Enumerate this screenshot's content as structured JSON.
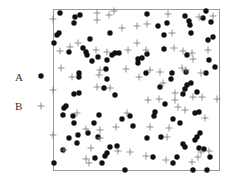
{
  "chart_data": {
    "type": "scatter",
    "title": "",
    "xlabel": "",
    "ylabel": "",
    "grid": false,
    "legend_position": "left",
    "frame": {
      "x0": 53,
      "y0": 9,
      "x1": 219,
      "y1": 170
    },
    "series": [
      {
        "name": "A",
        "marker": "filled-circle",
        "color": "#111111",
        "points": [
          [
            60,
            13
          ],
          [
            75,
            17
          ],
          [
            80,
            15
          ],
          [
            74,
            23
          ],
          [
            59,
            33
          ],
          [
            57,
            35
          ],
          [
            54,
            43
          ],
          [
            69,
            52
          ],
          [
            90,
            39
          ],
          [
            83,
            48
          ],
          [
            86,
            52
          ],
          [
            87,
            55
          ],
          [
            92,
            61
          ],
          [
            98,
            57
          ],
          [
            110,
            33
          ],
          [
            107,
            60
          ],
          [
            112,
            55
          ],
          [
            115,
            53
          ],
          [
            119,
            53
          ],
          [
            79,
            73
          ],
          [
            79,
            77
          ],
          [
            106,
            69
          ],
          [
            107,
            79
          ],
          [
            104,
            88
          ],
          [
            115,
            95
          ],
          [
            79,
            93
          ],
          [
            74,
            94
          ],
          [
            66,
            106
          ],
          [
            64,
            108
          ],
          [
            63,
            115
          ],
          [
            73,
            116
          ],
          [
            74,
            123
          ],
          [
            99,
            115
          ],
          [
            94,
            123
          ],
          [
            78,
            135
          ],
          [
            69,
            138
          ],
          [
            77,
            143
          ],
          [
            63,
            150
          ],
          [
            88,
            133
          ],
          [
            98,
            137
          ],
          [
            110,
            147
          ],
          [
            117,
            146
          ],
          [
            107,
            153
          ],
          [
            105,
            156
          ],
          [
            95,
            158
          ],
          [
            102,
            163
          ],
          [
            54,
            163
          ],
          [
            125,
            170
          ],
          [
            122,
            119
          ],
          [
            130,
            116
          ],
          [
            133,
            126
          ],
          [
            147,
            14
          ],
          [
            158,
            26
          ],
          [
            167,
            23
          ],
          [
            164,
            35
          ],
          [
            164,
            49
          ],
          [
            147,
            54
          ],
          [
            138,
            59
          ],
          [
            142,
            58
          ],
          [
            138,
            63
          ],
          [
            146,
            73
          ],
          [
            172,
            73
          ],
          [
            171,
            79
          ],
          [
            160,
            87
          ],
          [
            165,
            104
          ],
          [
            155,
            112
          ],
          [
            154,
            116
          ],
          [
            147,
            138
          ],
          [
            161,
            137
          ],
          [
            173,
            119
          ],
          [
            180,
            123
          ],
          [
            153,
            157
          ],
          [
            173,
            163
          ],
          [
            177,
            157
          ],
          [
            185,
            16
          ],
          [
            189,
            21
          ],
          [
            190,
            25
          ],
          [
            191,
            33
          ],
          [
            206,
            11
          ],
          [
            203,
            18
          ],
          [
            211,
            22
          ],
          [
            208,
            40
          ],
          [
            213,
            37
          ],
          [
            209,
            60
          ],
          [
            215,
            67
          ],
          [
            206,
            73
          ],
          [
            187,
            55
          ],
          [
            186,
            72
          ],
          [
            191,
            83
          ],
          [
            187,
            85
          ],
          [
            185,
            89
          ],
          [
            183,
            94
          ],
          [
            197,
            92
          ],
          [
            199,
            112
          ],
          [
            195,
            113
          ],
          [
            200,
            133
          ],
          [
            197,
            137
          ],
          [
            195,
            140
          ],
          [
            183,
            144
          ],
          [
            185,
            147
          ],
          [
            199,
            148
          ],
          [
            204,
            149
          ],
          [
            210,
            157
          ],
          [
            193,
            170
          ],
          [
            207,
            170
          ]
        ]
      },
      {
        "name": "B",
        "marker": "plus",
        "color": "#777777",
        "points": [
          [
            53,
            19
          ],
          [
            97,
            13
          ],
          [
            109,
            15
          ],
          [
            114,
            11
          ],
          [
            97,
            20
          ],
          [
            122,
            28
          ],
          [
            137,
            26
          ],
          [
            147,
            24
          ],
          [
            168,
            14
          ],
          [
            199,
            17
          ],
          [
            213,
            16
          ],
          [
            172,
            33
          ],
          [
            137,
            43
          ],
          [
            78,
            43
          ],
          [
            70,
            47
          ],
          [
            60,
            51
          ],
          [
            96,
            50
          ],
          [
            107,
            52
          ],
          [
            128,
            50
          ],
          [
            146,
            50
          ],
          [
            174,
            48
          ],
          [
            183,
            51
          ],
          [
            192,
            53
          ],
          [
            193,
            59
          ],
          [
            208,
            50
          ],
          [
            61,
            68
          ],
          [
            100,
            70
          ],
          [
            99,
            75
          ],
          [
            126,
            69
          ],
          [
            139,
            77
          ],
          [
            150,
            70
          ],
          [
            160,
            72
          ],
          [
            182,
            68
          ],
          [
            186,
            70
          ],
          [
            201,
            73
          ],
          [
            72,
            77
          ],
          [
            97,
            87
          ],
          [
            53,
            90
          ],
          [
            110,
            88
          ],
          [
            163,
            83
          ],
          [
            175,
            93
          ],
          [
            193,
            97
          ],
          [
            202,
            97
          ],
          [
            217,
            99
          ],
          [
            148,
            100
          ],
          [
            159,
            99
          ],
          [
            175,
            100
          ],
          [
            77,
            113
          ],
          [
            127,
            113
          ],
          [
            178,
            107
          ],
          [
            185,
            110
          ],
          [
            205,
            118
          ],
          [
            116,
            127
          ],
          [
            100,
            130
          ],
          [
            86,
            129
          ],
          [
            150,
            127
          ],
          [
            169,
            128
          ],
          [
            53,
            135
          ],
          [
            100,
            138
          ],
          [
            167,
            137
          ],
          [
            64,
            150
          ],
          [
            91,
            148
          ],
          [
            118,
            151
          ],
          [
            130,
            152
          ],
          [
            146,
            156
          ],
          [
            166,
            160
          ],
          [
            201,
            152
          ],
          [
            209,
            151
          ],
          [
            86,
            159
          ],
          [
            192,
            162
          ],
          [
            198,
            157
          ],
          [
            89,
            163
          ]
        ]
      }
    ]
  },
  "legend": {
    "items": [
      {
        "label": "A",
        "marker": "filled-circle",
        "label_x": 15,
        "label_y": 78,
        "marker_x": 41,
        "marker_y": 76
      },
      {
        "label": "B",
        "marker": "plus",
        "label_x": 15,
        "label_y": 107,
        "marker_x": 41,
        "marker_y": 106
      }
    ]
  }
}
